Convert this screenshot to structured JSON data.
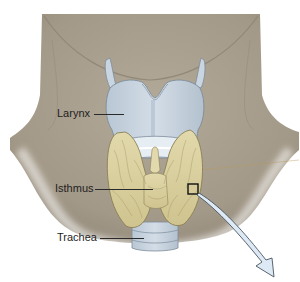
{
  "figure": {
    "colors": {
      "background": "#ffffff",
      "neck_skin": "#a89e8e",
      "neck_shadow": "#8f8577",
      "cartilage": "#c3d0dc",
      "cartilage_outline": "#7d8c9a",
      "thyroid": "#d9cf9f",
      "thyroid_outline": "#8a7f55",
      "arrow_fill": "#dde9f4",
      "arrow_outline": "#4a5560",
      "label_text": "#1e1e1e"
    }
  },
  "labels": [
    {
      "id": "larynx",
      "text": "Larynx"
    },
    {
      "id": "isthmus",
      "text": "Isthmus"
    },
    {
      "id": "trachea",
      "text": "Trachea"
    }
  ],
  "callout": {
    "box": "magnification-box",
    "arrow": "zoom-arrow"
  }
}
